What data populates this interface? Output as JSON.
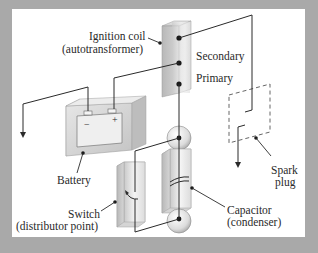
{
  "diagram": {
    "labels": {
      "ignition_coil_line1": "Ignition coil",
      "ignition_coil_line2": "(autotransformer)",
      "secondary": "Secondary",
      "primary": "Primary",
      "battery": "Battery",
      "battery_minus": "−",
      "battery_plus": "+",
      "spark_plug_line1": "Spark",
      "spark_plug_line2": "plug",
      "switch_line1": "Switch",
      "switch_line2": "(distributor point)",
      "capacitor_line1": "Capacitor",
      "capacitor_line2": "(condenser)"
    },
    "components": [
      {
        "name": "ignition-coil",
        "icon": "coil-block"
      },
      {
        "name": "battery",
        "icon": "battery-block"
      },
      {
        "name": "spark-plug",
        "icon": "dashed-gap"
      },
      {
        "name": "switch",
        "icon": "switch-block"
      },
      {
        "name": "capacitor",
        "icon": "capacitor-block"
      }
    ],
    "colors": {
      "background": "#a9a9a9",
      "panel": "#ffffff",
      "line": "#2a2a2a",
      "block_light": "#f2f2f2",
      "block_dark": "#c8c8c8"
    }
  }
}
